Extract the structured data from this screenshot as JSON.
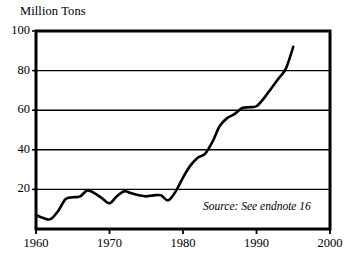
{
  "chart_data": {
    "type": "line",
    "title": "Million Tons",
    "xlabel": "",
    "ylabel": "Million Tons",
    "xlim": [
      1960,
      2000
    ],
    "ylim": [
      0,
      100
    ],
    "grid": true,
    "grid_axis": "y",
    "legend": "none",
    "y_ticks": [
      20,
      40,
      60,
      80,
      100
    ],
    "y_tick_labels": [
      "20",
      "40",
      "60",
      "80",
      "100"
    ],
    "x_ticks": [
      1960,
      1970,
      1980,
      1990,
      2000
    ],
    "x_tick_labels": [
      "1960",
      "1970",
      "1980",
      "1990",
      "2000"
    ],
    "annotations": [
      {
        "name": "source-note",
        "text": "Source: See endnote 16",
        "x": 1982,
        "y": 9,
        "style": "italic"
      }
    ],
    "series": [
      {
        "name": "Million Tons",
        "color": "#000000",
        "line_width": 2.6,
        "x": [
          1960,
          1961,
          1962,
          1963,
          1964,
          1965,
          1966,
          1967,
          1968,
          1969,
          1970,
          1971,
          1972,
          1973,
          1974,
          1975,
          1976,
          1977,
          1978,
          1979,
          1980,
          1981,
          1982,
          1983,
          1984,
          1985,
          1986,
          1987,
          1988,
          1989,
          1990,
          1991,
          1992,
          1993,
          1994,
          1995
        ],
        "values": [
          7,
          5.5,
          5,
          9,
          15,
          16,
          16.5,
          19.5,
          18,
          15.5,
          13,
          16.5,
          19,
          18,
          17,
          16.5,
          17,
          17,
          14.5,
          19,
          26,
          32,
          36,
          38,
          44,
          52,
          56,
          58,
          61,
          61.5,
          62,
          66,
          71,
          76,
          81,
          92
        ]
      }
    ]
  }
}
